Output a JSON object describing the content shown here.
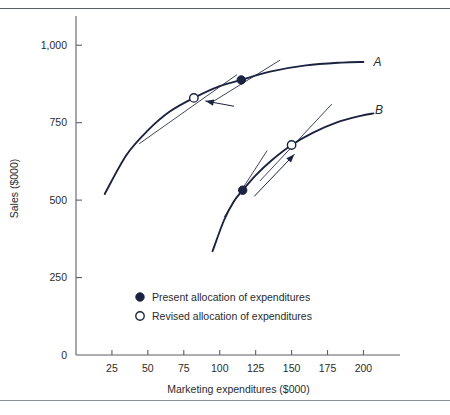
{
  "chart_data": {
    "type": "line",
    "title": "",
    "xlabel": "Marketing expenditures ($000)",
    "ylabel": "Sales ($000)",
    "xlim": [
      0,
      215
    ],
    "ylim": [
      0,
      1075
    ],
    "xticks": [
      25,
      50,
      75,
      100,
      125,
      150,
      175,
      200
    ],
    "xtick_labels": [
      "25",
      "50",
      "75",
      "100",
      "125",
      "150",
      "175",
      "200"
    ],
    "yticks": [
      0,
      250,
      500,
      750,
      1000
    ],
    "ytick_labels": [
      "0",
      "250",
      "500",
      "750",
      "1,000"
    ],
    "grid": false,
    "legend_position": "lower-center-inside",
    "series": [
      {
        "name": "A",
        "label": "A",
        "label_x": 207,
        "label_y": 945,
        "points": [
          {
            "x": 20,
            "y": 520
          },
          {
            "x": 35,
            "y": 645
          },
          {
            "x": 50,
            "y": 725
          },
          {
            "x": 65,
            "y": 785
          },
          {
            "x": 82,
            "y": 830
          },
          {
            "x": 100,
            "y": 868
          },
          {
            "x": 115,
            "y": 888
          },
          {
            "x": 135,
            "y": 915
          },
          {
            "x": 160,
            "y": 935
          },
          {
            "x": 185,
            "y": 944
          },
          {
            "x": 200,
            "y": 946
          }
        ],
        "present_allocation": {
          "x": 115,
          "y": 888
        },
        "revised_allocation": {
          "x": 82,
          "y": 830
        },
        "tangent_present": {
          "x1": 96,
          "y1": 820,
          "x2": 142,
          "y2": 952
        },
        "tangent_revised": {
          "x1": 44,
          "y1": 682,
          "x2": 112,
          "y2": 905
        },
        "arrow": {
          "x1": 110,
          "y1": 803,
          "x2": 90,
          "y2": 820,
          "direction": "left-down"
        }
      },
      {
        "name": "B",
        "label": "B",
        "label_x": 208,
        "label_y": 792,
        "points": [
          {
            "x": 95,
            "y": 335
          },
          {
            "x": 103,
            "y": 435
          },
          {
            "x": 110,
            "y": 497
          },
          {
            "x": 116,
            "y": 532
          },
          {
            "x": 125,
            "y": 580
          },
          {
            "x": 136,
            "y": 628
          },
          {
            "x": 150,
            "y": 678
          },
          {
            "x": 165,
            "y": 718
          },
          {
            "x": 182,
            "y": 752
          },
          {
            "x": 198,
            "y": 772
          },
          {
            "x": 207,
            "y": 780
          }
        ],
        "present_allocation": {
          "x": 116,
          "y": 532
        },
        "revised_allocation": {
          "x": 150,
          "y": 678
        },
        "tangent_present": {
          "x1": 103,
          "y1": 445,
          "x2": 133,
          "y2": 660
        },
        "tangent_revised": {
          "x1": 128,
          "y1": 562,
          "x2": 178,
          "y2": 810
        },
        "arrow": {
          "x1": 124,
          "y1": 512,
          "x2": 152,
          "y2": 648,
          "direction": "right-up"
        }
      }
    ],
    "legend": [
      {
        "marker": "filled-circle",
        "label": "Present allocation of expenditures"
      },
      {
        "marker": "open-circle",
        "label": "Revised allocation of expenditures"
      }
    ],
    "colors": {
      "curve": "#1c2340",
      "axis": "#5a5f66",
      "text": "#2b2b2b",
      "marker_fill": "#1c2340",
      "marker_open_fill": "#ffffff",
      "background": "#ffffff",
      "rule": "#5a5f66"
    }
  }
}
